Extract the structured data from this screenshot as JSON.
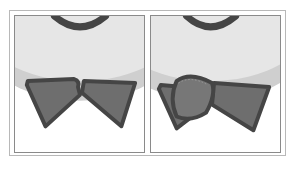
{
  "figure": {
    "panels": [
      {
        "id": "before",
        "shapes": [
          "face-bottom",
          "mouth-arc",
          "bowtie-left-wing",
          "bowtie-right-wing"
        ]
      },
      {
        "id": "after",
        "shapes": [
          "face-bottom",
          "mouth-arc",
          "bowtie-left-wing",
          "bowtie-right-wing",
          "selected-rounded-overlay"
        ]
      }
    ],
    "colors": {
      "face_fill": "#e6e6e6",
      "face_shadow": "#cfcfcf",
      "outline": "#454545",
      "bowtie_fill": "#6e6e6e",
      "overlay_fill": "#777777",
      "frame_border": "#8a8a8a"
    }
  }
}
